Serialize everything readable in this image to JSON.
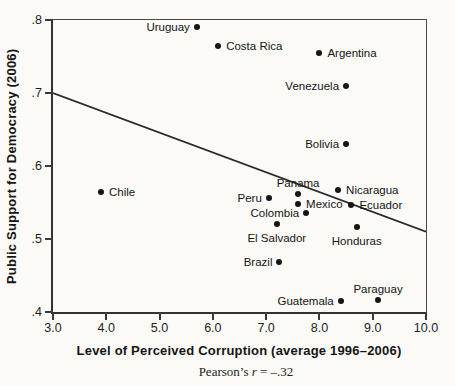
{
  "chart_data": {
    "type": "scatter",
    "title": "",
    "xlabel": "Level of Perceived Corruption (average 1996–2006)",
    "ylabel": "Public Support for Democracy (2006)",
    "caption": {
      "prefix": "Pearson’s ",
      "variable": "r",
      "value": " = –.32"
    },
    "xlim": [
      3.0,
      10.0
    ],
    "ylim": [
      0.4,
      0.8
    ],
    "grid": false,
    "legend": "none",
    "x_ticks": [
      {
        "label": "3.0",
        "value": 3.0
      },
      {
        "label": "4.0",
        "value": 4.0
      },
      {
        "label": "5.0",
        "value": 5.0
      },
      {
        "label": "6.0",
        "value": 6.0
      },
      {
        "label": "7.0",
        "value": 7.0
      },
      {
        "label": "8.0",
        "value": 8.0
      },
      {
        "label": "9.0",
        "value": 9.0
      },
      {
        "label": "10.0",
        "value": 10.0
      }
    ],
    "y_ticks": [
      {
        "label": ".4",
        "value": 0.4
      },
      {
        "label": ".5",
        "value": 0.5
      },
      {
        "label": ".6",
        "value": 0.6
      },
      {
        "label": ".7",
        "value": 0.7
      },
      {
        "label": ".8",
        "value": 0.8
      }
    ],
    "points": [
      {
        "country": "Uruguay",
        "x": 5.7,
        "y": 0.79,
        "label_side": "left"
      },
      {
        "country": "Costa Rica",
        "x": 6.1,
        "y": 0.765,
        "label_side": "right"
      },
      {
        "country": "Argentina",
        "x": 8.0,
        "y": 0.755,
        "label_side": "right"
      },
      {
        "country": "Venezuela",
        "x": 8.5,
        "y": 0.71,
        "label_side": "left"
      },
      {
        "country": "Bolivia",
        "x": 8.5,
        "y": 0.63,
        "label_side": "left"
      },
      {
        "country": "Chile",
        "x": 3.9,
        "y": 0.565,
        "label_side": "right"
      },
      {
        "country": "Nicaragua",
        "x": 8.35,
        "y": 0.567,
        "label_side": "right"
      },
      {
        "country": "Panama",
        "x": 7.6,
        "y": 0.562,
        "label_side": "above"
      },
      {
        "country": "Peru",
        "x": 7.05,
        "y": 0.556,
        "label_side": "left"
      },
      {
        "country": "Mexico",
        "x": 7.6,
        "y": 0.548,
        "label_side": "right"
      },
      {
        "country": "Ecuador",
        "x": 8.6,
        "y": 0.547,
        "label_side": "right"
      },
      {
        "country": "Colombia",
        "x": 7.75,
        "y": 0.536,
        "label_side": "left"
      },
      {
        "country": "El Salvador",
        "x": 7.2,
        "y": 0.52,
        "label_side": "below"
      },
      {
        "country": "Honduras",
        "x": 8.7,
        "y": 0.517,
        "label_side": "below"
      },
      {
        "country": "Brazil",
        "x": 7.25,
        "y": 0.468,
        "label_side": "left"
      },
      {
        "country": "Guatemala",
        "x": 8.4,
        "y": 0.415,
        "label_side": "left"
      },
      {
        "country": "Paraguay",
        "x": 9.1,
        "y": 0.416,
        "label_side": "above"
      }
    ],
    "trendline": {
      "x1": 3.0,
      "y1": 0.7,
      "x2": 10.0,
      "y2": 0.51
    },
    "colors": {
      "background": "#fbfaf7",
      "axis": "#3a3a3a",
      "dot": "#151515",
      "trendline": "#2a2a2a",
      "text": "#151515"
    }
  }
}
